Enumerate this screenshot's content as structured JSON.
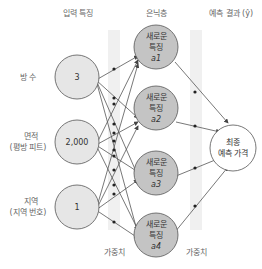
{
  "headers": {
    "input": "입력 특징",
    "hidden": "은닉층",
    "output": "예측 결과 (ŷ)"
  },
  "inputs": [
    {
      "label": "방 수",
      "sublabel": "",
      "value": "3"
    },
    {
      "label": "면적",
      "sublabel": "(평방 피트)",
      "value": "2,000"
    },
    {
      "label": "지역",
      "sublabel": "(지역 번호)",
      "value": "1"
    }
  ],
  "hidden": [
    {
      "line1": "새로운",
      "line2": "특징",
      "name": "a1"
    },
    {
      "line1": "새로운",
      "line2": "특징",
      "name": "a2"
    },
    {
      "line1": "새로운",
      "line2": "특징",
      "name": "a3"
    },
    {
      "line1": "새로운",
      "line2": "특징",
      "name": "a4"
    }
  ],
  "output": {
    "line1": "최종",
    "line2": "예측 가격"
  },
  "weights": {
    "label1": "가중치",
    "label2": "가중치"
  },
  "colors": {
    "input_fill": "#e6e6e6",
    "hidden_fill": "#c4c4c4",
    "output_fill": "#ffffff",
    "band": "#f0f0f0",
    "stroke": "#555555"
  }
}
